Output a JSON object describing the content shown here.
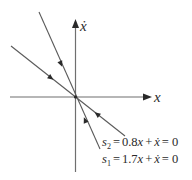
{
  "diagram": {
    "type": "phase-plane",
    "axes": {
      "x_label": "x",
      "y_label": "ẋ"
    },
    "sliding_lines": [
      {
        "id": "s2",
        "label_var": "s",
        "label_sub": "2",
        "equals": "=",
        "coef": "0.8",
        "x_var": "x",
        "plus": "+",
        "xdot_var": "ẋ",
        "rhs": "= 0",
        "full_text": "s₂ = 0.8x + ẋ = 0",
        "arrows_toward_origin": true
      },
      {
        "id": "s1",
        "label_var": "s",
        "label_sub": "1",
        "equals": "=",
        "coef": "1.7",
        "x_var": "x",
        "plus": "+",
        "xdot_var": "ẋ",
        "rhs": "= 0",
        "full_text": "s₁ = 1.7x + ẋ = 0",
        "arrows_toward_origin": true
      }
    ]
  },
  "chart_data": {
    "type": "line",
    "title": "",
    "xlabel": "x",
    "ylabel": "ẋ",
    "series": [
      {
        "name": "s₂ = 0.8x + ẋ = 0",
        "equation": "ẋ = -0.8x",
        "slope": -0.8,
        "direction": "toward origin"
      },
      {
        "name": "s₁ = 1.7x + ẋ = 0",
        "equation": "ẋ = -1.7x",
        "slope": -1.7,
        "direction": "toward origin"
      }
    ],
    "grid": false,
    "legend": "bottom-right annotations"
  }
}
